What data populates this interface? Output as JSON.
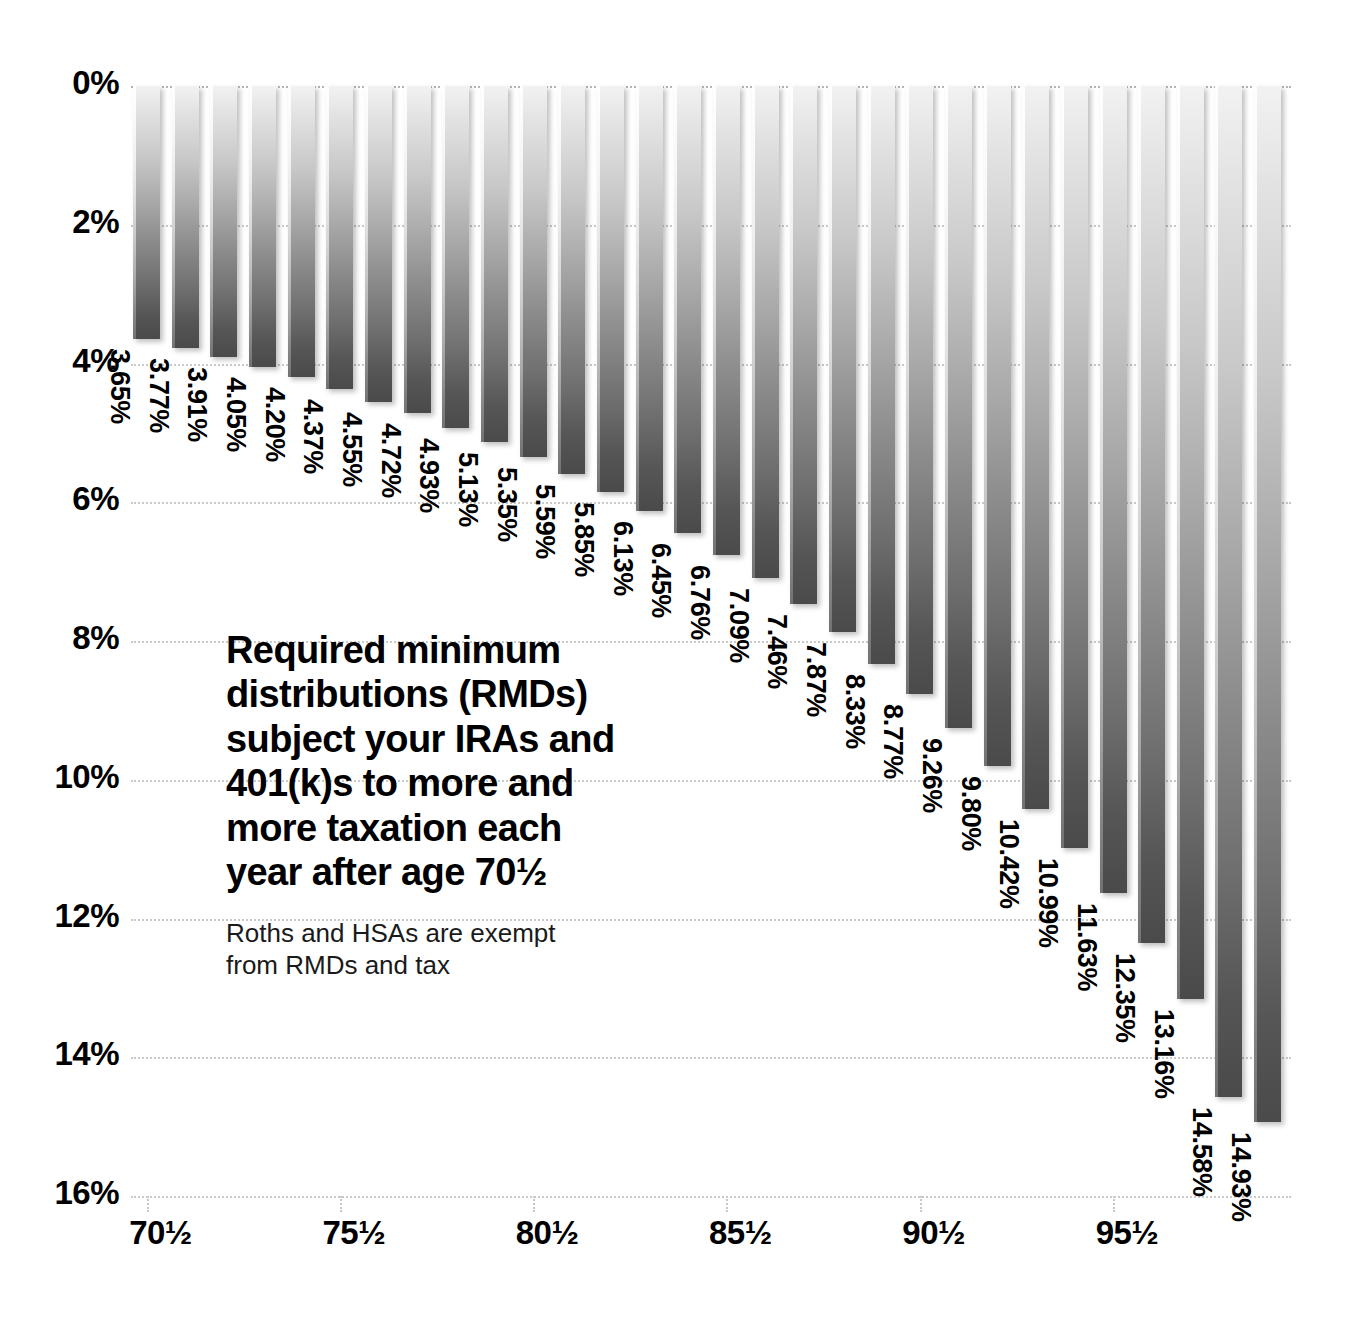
{
  "chart_data": {
    "type": "bar",
    "title": "Required minimum distributions (RMDs) subject your IRAs and 401(k)s to more and more taxation each year after age 70½",
    "subtitle": "Roths and HSAs are exempt from RMDs and tax",
    "xlabel": "",
    "ylabel": "",
    "ylim": [
      0,
      16
    ],
    "y_inverted": true,
    "grid": true,
    "legend": "none",
    "y_ticks": [
      "0%",
      "2%",
      "4%",
      "6%",
      "8%",
      "10%",
      "12%",
      "14%",
      "16%"
    ],
    "y_tick_values": [
      0,
      2,
      4,
      6,
      8,
      10,
      12,
      14,
      16
    ],
    "x_ticks": [
      "70½",
      "75½",
      "80½",
      "85½",
      "90½",
      "95½"
    ],
    "x_tick_indices": [
      0,
      5,
      10,
      15,
      20,
      25
    ],
    "categories": [
      "70½",
      "71½",
      "72½",
      "73½",
      "74½",
      "75½",
      "76½",
      "77½",
      "78½",
      "79½",
      "80½",
      "81½",
      "82½",
      "83½",
      "84½",
      "85½",
      "86½",
      "87½",
      "88½",
      "89½",
      "90½",
      "91½",
      "92½",
      "93½",
      "94½",
      "95½",
      "96½",
      "97½",
      "98½",
      "99½"
    ],
    "values": [
      3.65,
      3.77,
      3.91,
      4.05,
      4.2,
      4.37,
      4.55,
      4.72,
      4.93,
      5.13,
      5.35,
      5.59,
      5.85,
      6.13,
      6.45,
      6.76,
      7.09,
      7.46,
      7.87,
      8.33,
      8.77,
      9.26,
      9.8,
      10.42,
      10.99,
      11.63,
      12.35,
      13.16,
      14.58,
      14.93
    ],
    "data_labels": [
      "3.65%",
      "3.77%",
      "3.91%",
      "4.05%",
      "4.20%",
      "4.37%",
      "4.55%",
      "4.72%",
      "4.93%",
      "5.13%",
      "5.35%",
      "5.59%",
      "5.85%",
      "6.13%",
      "6.45%",
      "6.76%",
      "7.09%",
      "7.46%",
      "7.87%",
      "8.33%",
      "8.77%",
      "9.26%",
      "9.80%",
      "10.42%",
      "10.99%",
      "11.63%",
      "12.35%",
      "13.16%",
      "14.58%",
      "14.93%"
    ],
    "colors": {
      "bar_gradient_top": "#f2f2f2",
      "bar_gradient_bottom": "#4a4a4a",
      "gridline": "#c9c9c9",
      "text": "#000000",
      "background": "#ffffff"
    }
  },
  "title_block": {
    "line1": "Required minimum",
    "line2": "distributions (RMDs)",
    "line3": "subject your IRAs and",
    "line4": "401(k)s to more and",
    "line5": "more taxation each",
    "line6": "year after age 70½",
    "sub_line1": "Roths and HSAs are exempt",
    "sub_line2": "from RMDs and tax"
  }
}
